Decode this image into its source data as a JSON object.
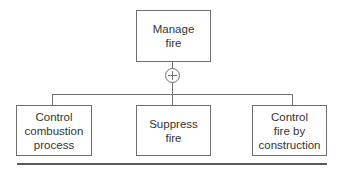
{
  "diagram": {
    "type": "decomposition-tree",
    "root": {
      "id": "manage-fire",
      "label": "Manage\nfire"
    },
    "connector": {
      "type": "or-gate",
      "symbol": "⊕",
      "icon": "circle-plus-icon"
    },
    "children": [
      {
        "id": "control-combustion-process",
        "label": "Control\ncombustion\nprocess"
      },
      {
        "id": "suppress-fire",
        "label": "Suppress\nfire"
      },
      {
        "id": "control-fire-by-construction",
        "label": "Control\nfire by\nconstruction"
      }
    ],
    "colors": {
      "stroke": "#6e6e6e",
      "text": "#333333",
      "background": "#ffffff"
    }
  }
}
